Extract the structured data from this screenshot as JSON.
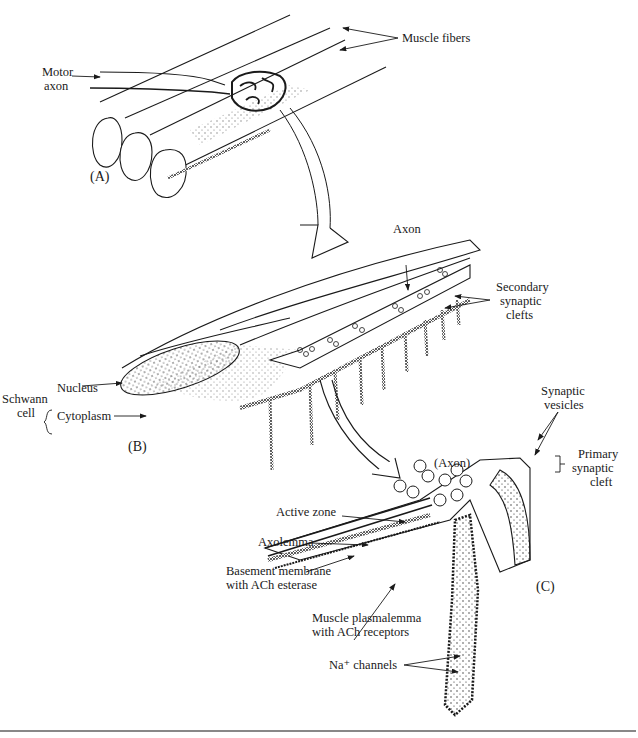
{
  "figure": {
    "panels": {
      "a": "(A)",
      "b": "(B)",
      "c": "(C)"
    },
    "labels": {
      "muscle_fibers": "Muscle fibers",
      "motor_axon_1": "Motor",
      "motor_axon_2": "axon",
      "axon_b": "Axon",
      "secondary_1": "Secondary",
      "secondary_2": "synaptic",
      "secondary_3": "clefts",
      "schwann_1": "Schwann",
      "schwann_2": "cell",
      "nucleus": "Nucleus",
      "cytoplasm": "Cytoplasm",
      "synaptic_vesicles_1": "Synaptic",
      "synaptic_vesicles_2": "vesicles",
      "axon_c": "(Axon)",
      "primary_1": "Primary",
      "primary_2": "synaptic",
      "primary_3": "cleft",
      "active_zone": "Active zone",
      "axolemma": "Axolemma",
      "basement_1": "Basement membrane",
      "basement_2": "with ACh esterase",
      "plasmalemma_1": "Muscle plasmalemma",
      "plasmalemma_2": "with ACh receptors",
      "na_channels": "Na⁺ channels"
    },
    "colors": {
      "ink": "#1a1a1a",
      "background": "#ffffff",
      "rule": "#888888"
    }
  }
}
